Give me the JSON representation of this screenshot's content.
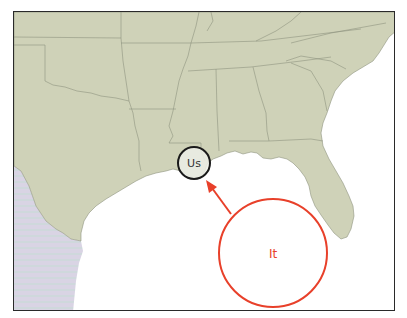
{
  "map": {
    "region": "Southeastern United States and Gulf of Mexico",
    "colors": {
      "land": "#cfd2b8",
      "state_border": "#8f9480",
      "water": "#ffffff",
      "mexico": "#d7d3e3",
      "frame": "#2a2a2a"
    }
  },
  "annotations": {
    "us_marker": {
      "label": "Us",
      "color": "#1a1a1a"
    },
    "it_marker": {
      "label": "It",
      "color": "#e8402a"
    },
    "arrow": {
      "from": "it_marker",
      "to": "us_marker",
      "color": "#e8402a"
    }
  }
}
